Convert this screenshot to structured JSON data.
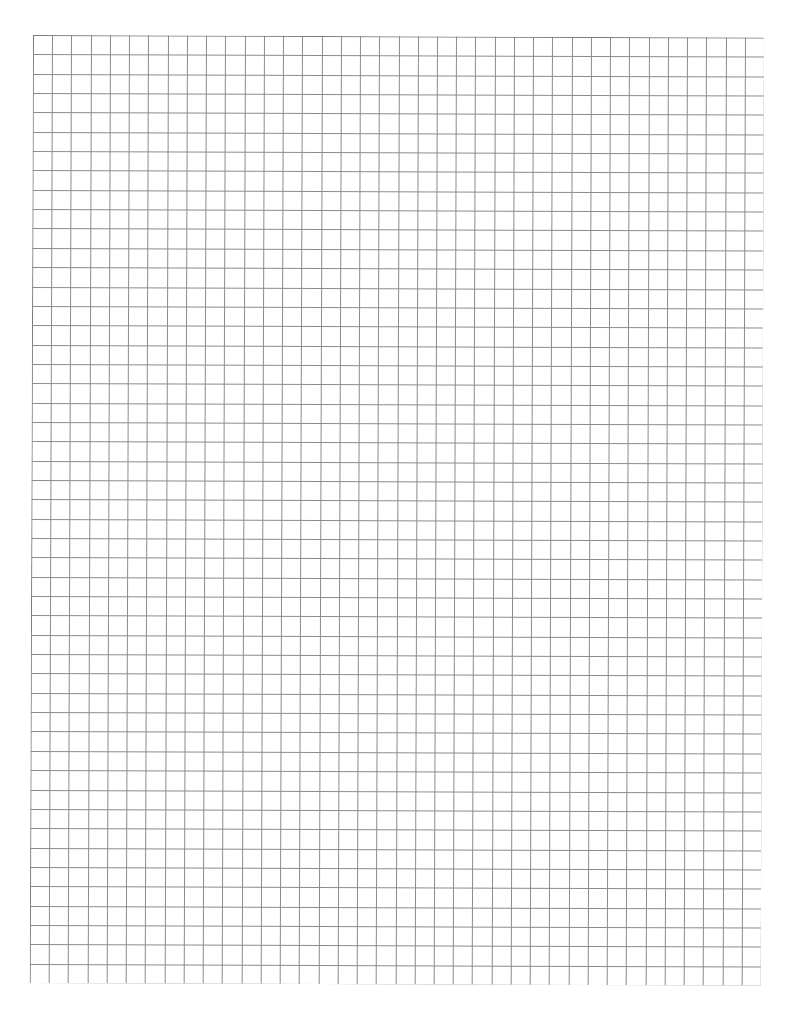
{
  "document": {
    "type": "graph-paper",
    "grid": {
      "columns": 38,
      "rows": 49,
      "cell_size_px": 19.25,
      "line_color": "#8c8c8c",
      "border_color": "#7a7a7a"
    }
  }
}
